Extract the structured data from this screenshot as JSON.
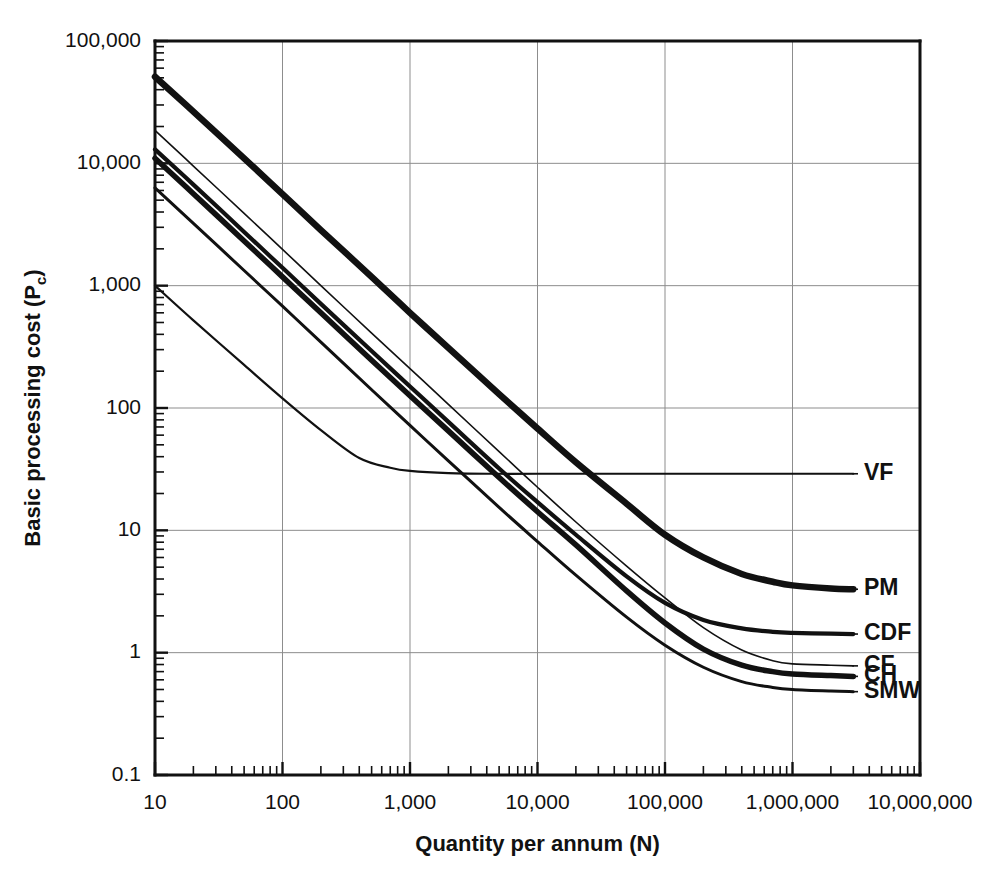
{
  "chart_data": {
    "type": "line",
    "title": "",
    "xlabel": "Quantity per annum (N)",
    "ylabel": "Basic processing cost (Pc)",
    "ylabel_main": "Basic processing cost (P",
    "ylabel_sub": "c",
    "ylabel_tail": ")",
    "scale": {
      "x": "log",
      "y": "log"
    },
    "xlim": [
      10,
      10000000
    ],
    "ylim": [
      0.1,
      100000
    ],
    "grid": true,
    "legend_position": "right-inline-labels",
    "xticks": [
      10,
      100,
      1000,
      10000,
      100000,
      1000000,
      10000000
    ],
    "xtick_labels": [
      "10",
      "100",
      "1,000",
      "10,000",
      "100,000",
      "1,000,000",
      "10,000,000"
    ],
    "yticks": [
      0.1,
      1,
      10,
      100,
      1000,
      10000,
      100000
    ],
    "ytick_labels": [
      "0.1",
      "1",
      "10",
      "100",
      "1,000",
      "10,000",
      "100,000"
    ],
    "series": [
      {
        "name": "PM",
        "label": "PM",
        "stroke_width": 6.5,
        "label_y_value": 3.3,
        "points": [
          [
            10,
            51000
          ],
          [
            20,
            26500
          ],
          [
            50,
            11000
          ],
          [
            100,
            5600
          ],
          [
            200,
            2850
          ],
          [
            500,
            1180
          ],
          [
            1000,
            600
          ],
          [
            2000,
            310
          ],
          [
            5000,
            130
          ],
          [
            10000,
            68
          ],
          [
            20000,
            36
          ],
          [
            50000,
            16.5
          ],
          [
            100000,
            9.2
          ],
          [
            200000,
            6.0
          ],
          [
            400000,
            4.4
          ],
          [
            700000,
            3.8
          ],
          [
            1000000,
            3.55
          ],
          [
            2000000,
            3.35
          ],
          [
            3000000,
            3.3
          ]
        ]
      },
      {
        "name": "VF",
        "label": "VF",
        "stroke_width": 2.2,
        "label_y_value": 29,
        "points": [
          [
            10,
            1000
          ],
          [
            20,
            520
          ],
          [
            50,
            225
          ],
          [
            100,
            120
          ],
          [
            200,
            66
          ],
          [
            400,
            39
          ],
          [
            700,
            32.5
          ],
          [
            1000,
            30.6
          ],
          [
            2000,
            29.4
          ],
          [
            5000,
            29.0
          ],
          [
            10000,
            29.0
          ],
          [
            100000,
            29.0
          ],
          [
            1000000,
            29.0
          ],
          [
            3000000,
            29.0
          ]
        ]
      },
      {
        "name": "CDF",
        "label": "CDF",
        "stroke_width": 4.2,
        "label_y_value": 1.42,
        "points": [
          [
            10,
            13000
          ],
          [
            20,
            6700
          ],
          [
            50,
            2750
          ],
          [
            100,
            1400
          ],
          [
            200,
            710
          ],
          [
            500,
            292
          ],
          [
            1000,
            150
          ],
          [
            2000,
            77
          ],
          [
            5000,
            32
          ],
          [
            10000,
            17
          ],
          [
            20000,
            9.2
          ],
          [
            50000,
            4.2
          ],
          [
            100000,
            2.55
          ],
          [
            200000,
            1.85
          ],
          [
            400000,
            1.58
          ],
          [
            700000,
            1.48
          ],
          [
            1000000,
            1.45
          ],
          [
            2000000,
            1.43
          ],
          [
            3000000,
            1.42
          ]
        ]
      },
      {
        "name": "CF",
        "label": "CF",
        "stroke_width": 1.6,
        "label_y_value": 0.78,
        "points": [
          [
            10,
            18600
          ],
          [
            20,
            9500
          ],
          [
            50,
            3900
          ],
          [
            100,
            1980
          ],
          [
            200,
            1000
          ],
          [
            500,
            410
          ],
          [
            1000,
            210
          ],
          [
            2000,
            107
          ],
          [
            5000,
            44
          ],
          [
            10000,
            22.5
          ],
          [
            20000,
            11.7
          ],
          [
            50000,
            5.1
          ],
          [
            100000,
            2.8
          ],
          [
            200000,
            1.6
          ],
          [
            400000,
            1.05
          ],
          [
            700000,
            0.86
          ],
          [
            1000000,
            0.81
          ],
          [
            2000000,
            0.79
          ],
          [
            3000000,
            0.78
          ]
        ]
      },
      {
        "name": "CH",
        "label": "CH",
        "stroke_width": 5.5,
        "label_y_value": 0.64,
        "points": [
          [
            10,
            11000
          ],
          [
            20,
            5650
          ],
          [
            50,
            2320
          ],
          [
            100,
            1180
          ],
          [
            200,
            600
          ],
          [
            500,
            246
          ],
          [
            1000,
            126
          ],
          [
            2000,
            65
          ],
          [
            5000,
            27
          ],
          [
            10000,
            14.2
          ],
          [
            20000,
            7.6
          ],
          [
            50000,
            3.2
          ],
          [
            100000,
            1.75
          ],
          [
            200000,
            1.07
          ],
          [
            400000,
            0.79
          ],
          [
            700000,
            0.7
          ],
          [
            1000000,
            0.67
          ],
          [
            2000000,
            0.65
          ],
          [
            3000000,
            0.64
          ]
        ]
      },
      {
        "name": "SMW",
        "label": "SMW",
        "stroke_width": 3.0,
        "label_y_value": 0.48,
        "points": [
          [
            10,
            6300
          ],
          [
            20,
            3230
          ],
          [
            50,
            1330
          ],
          [
            100,
            680
          ],
          [
            200,
            345
          ],
          [
            500,
            141
          ],
          [
            1000,
            72
          ],
          [
            2000,
            37
          ],
          [
            5000,
            15.4
          ],
          [
            10000,
            8.1
          ],
          [
            20000,
            4.3
          ],
          [
            50000,
            1.95
          ],
          [
            100000,
            1.15
          ],
          [
            200000,
            0.76
          ],
          [
            400000,
            0.58
          ],
          [
            700000,
            0.52
          ],
          [
            1000000,
            0.5
          ],
          [
            2000000,
            0.485
          ],
          [
            3000000,
            0.48
          ]
        ]
      }
    ]
  },
  "colors": {
    "curve": "#111111",
    "grid": "#8d8d8d",
    "axis": "#111111",
    "background": "#ffffff"
  }
}
